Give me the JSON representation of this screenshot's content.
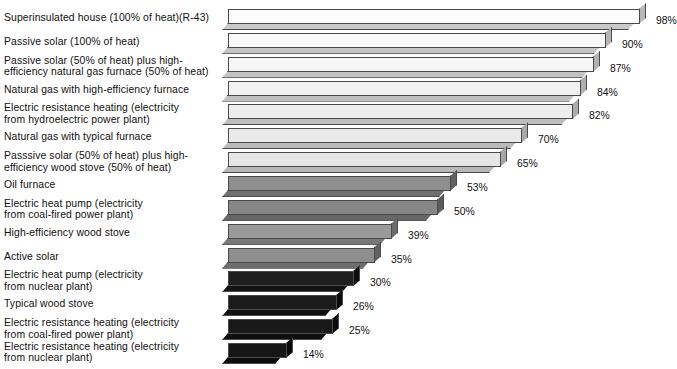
{
  "title_fragment": "",
  "chart_data": {
    "type": "bar",
    "orientation": "horizontal",
    "title": "",
    "subtitle": "",
    "xlabel": "",
    "ylabel": "",
    "xlim": [
      0,
      100
    ],
    "grid": false,
    "legend": "none",
    "value_suffix": "%",
    "categories": [
      "Superinsulated house (100% of heat)(R-43)",
      "Passive solar (100% of heat)",
      "Passive solar (50% of heat) plus high-\nefficiency natural gas furnace (50% of heat)",
      "Natural gas with high-efficiency furnace",
      "Electric resistance heating (electricity\nfrom hydroelectric power plant)",
      "Natural gas with typical furnace",
      "Passsive solar (50% of heat) plus high-\nefficiency wood stove (50% of heat)",
      "Oil furnace",
      "Electric heat pump (electricity\nfrom coal-fired power plant)",
      "High-efficiency wood stove",
      "Active solar",
      "Electric heat pump (electricity\nfrom nuclear plant)",
      "Typical wood stove",
      "Electric resistance heating (electricity\nfrom coal-fired power plant)",
      "Electric resistance heating (electricity\nfrom nuclear plant)"
    ],
    "values": [
      98,
      90,
      87,
      84,
      82,
      70,
      65,
      53,
      50,
      39,
      35,
      30,
      26,
      25,
      14
    ],
    "value_labels": [
      "98%",
      "90%",
      "87%",
      "84%",
      "82%",
      "70%",
      "65%",
      "53%",
      "50%",
      "39%",
      "35%",
      "30%",
      "26%",
      "25%",
      "14%"
    ],
    "bar_colors": [
      "#fdfdfd",
      "#fafafa",
      "#f6f6f6",
      "#f2f2f2",
      "#eeeeee",
      "#eaeaea",
      "#e6e6e6",
      "#8f8f8f",
      "#868686",
      "#9a9a9a",
      "#8e8e8e",
      "#1e1e1e",
      "#1b1b1b",
      "#191919",
      "#161616"
    ],
    "bar_shade_colors": [
      "#c9c9c9",
      "#c6c6c6",
      "#c3c3c3",
      "#c0c0c0",
      "#bdbdbd",
      "#bababa",
      "#b7b7b7",
      "#6f6f6f",
      "#676767",
      "#787878",
      "#6e6e6e",
      "#121212",
      "#101010",
      "#0e0e0e",
      "#0c0c0c"
    ],
    "bar_cap_colors": [
      "#b8b8b8",
      "#b5b5b5",
      "#b2b2b2",
      "#afafaf",
      "#acacac",
      "#a9a9a9",
      "#a6a6a6",
      "#626262",
      "#5b5b5b",
      "#6b6b6b",
      "#616161",
      "#0d0d0d",
      "#0b0b0b",
      "#0a0a0a",
      "#080808"
    ],
    "label_two_line_flags": [
      false,
      false,
      true,
      false,
      true,
      false,
      true,
      false,
      true,
      false,
      false,
      true,
      false,
      true,
      true
    ]
  }
}
